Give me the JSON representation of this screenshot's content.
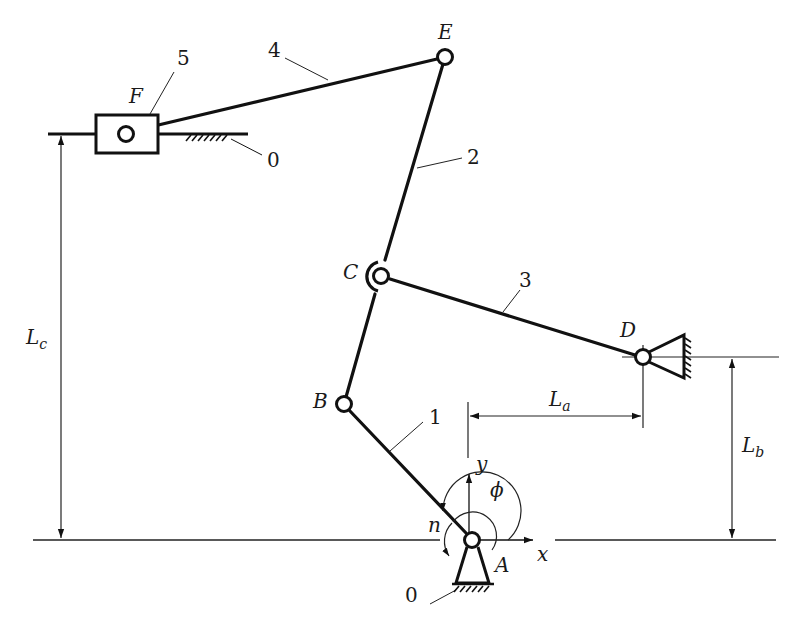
{
  "figure": {
    "type": "planar-linkage-mechanism",
    "joints": {
      "A": {
        "label": "A",
        "x": 472,
        "y": 540,
        "kind": "ground-pivot"
      },
      "B": {
        "label": "B",
        "x": 344,
        "y": 404,
        "kind": "revolute"
      },
      "C": {
        "label": "C",
        "x": 381,
        "y": 276,
        "kind": "revolute-double"
      },
      "D": {
        "label": "D",
        "x": 643,
        "y": 357,
        "kind": "ground-pivot"
      },
      "E": {
        "label": "E",
        "x": 445,
        "y": 57,
        "kind": "revolute"
      },
      "F": {
        "label": "F",
        "x": 126,
        "y": 134,
        "kind": "slider-pin"
      }
    },
    "links": [
      {
        "id": "1",
        "label": "1",
        "from": "A",
        "to": "B"
      },
      {
        "id": "2",
        "label": "2",
        "from": "B",
        "to": "E"
      },
      {
        "id": "3",
        "label": "3",
        "from": "C",
        "to": "D"
      },
      {
        "id": "4",
        "label": "4",
        "from": "E",
        "to": "F"
      },
      {
        "id": "5",
        "label": "5",
        "kind": "slider block"
      }
    ],
    "ground_labels": [
      "0",
      "0"
    ],
    "axes": {
      "x_label": "x",
      "y_label": "y"
    },
    "angle_label": "ϕ",
    "speed_label": "n",
    "dimensions": {
      "La": {
        "main": "L",
        "sub": "a"
      },
      "Lb": {
        "main": "L",
        "sub": "b"
      },
      "Lc": {
        "main": "L",
        "sub": "c"
      }
    }
  }
}
